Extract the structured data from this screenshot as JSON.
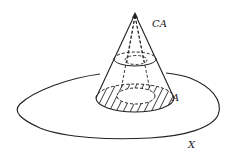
{
  "diagram": {
    "type": "cone-over-subspace",
    "labels": {
      "cone": "CA",
      "subspace": "A",
      "space": "X"
    },
    "colors": {
      "stroke": "#222222",
      "background": "#ffffff"
    }
  }
}
